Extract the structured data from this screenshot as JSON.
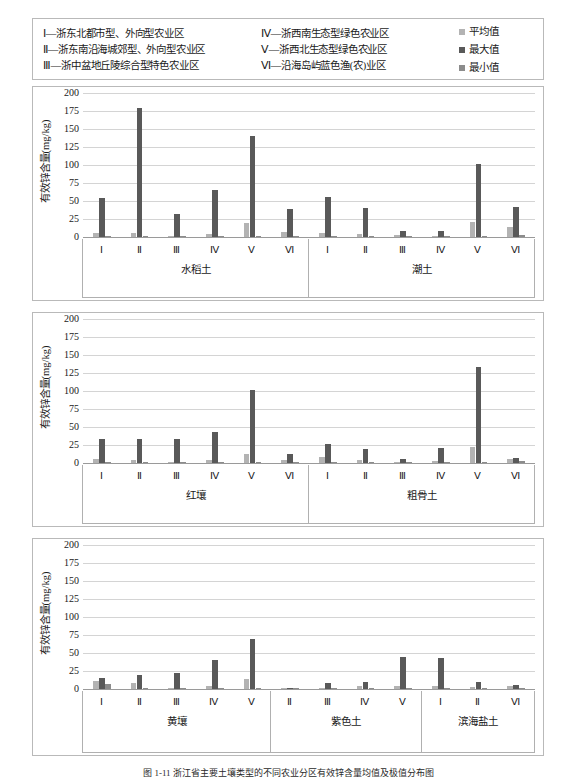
{
  "legend": {
    "regions_left": [
      "Ⅰ—浙东北都市型、外向型农业区",
      "Ⅱ—浙东南沿海城郊型、外向型农业区",
      "Ⅲ—浙中盆地丘陵综合型特色农业区"
    ],
    "regions_right": [
      "Ⅳ—浙西南生态型绿色农业区",
      "Ⅴ—浙西北生态型绿色农业区",
      "Ⅵ—沿海岛屿蓝色渔(农)业区"
    ],
    "series": [
      {
        "label": "平均值",
        "color": "#b3b3b3"
      },
      {
        "label": "最大值",
        "color": "#595959"
      },
      {
        "label": "最小值",
        "color": "#8c8c8c"
      }
    ]
  },
  "caption": "图 1-11  浙江省主要土壤类型的不同农业分区有效锌含量均值及极值分布图",
  "chart_data": [
    {
      "type": "bar",
      "title": "",
      "ylabel": "有效锌含量(mg/kg)",
      "ylim": [
        0,
        200
      ],
      "yticks": [
        0,
        25,
        50,
        75,
        100,
        125,
        150,
        175,
        200
      ],
      "grid": true,
      "legend_position": "top-right",
      "series_names": [
        "平均值",
        "最大值",
        "最小值"
      ],
      "groups": [
        {
          "name": "水稻土",
          "categories": [
            "Ⅰ",
            "Ⅱ",
            "Ⅲ",
            "Ⅳ",
            "Ⅴ",
            "Ⅵ"
          ],
          "series": [
            {
              "name": "平均值",
              "values": [
                5.5,
                6.0,
                2.0,
                4.5,
                19.5,
                7.5
              ]
            },
            {
              "name": "最大值",
              "values": [
                54.0,
                179.0,
                32.5,
                65.5,
                140.5,
                38.5
              ]
            },
            {
              "name": "最小值",
              "values": [
                0.4,
                0.4,
                0.3,
                0.3,
                0.5,
                0.5
              ]
            }
          ]
        },
        {
          "name": "潮土",
          "categories": [
            "Ⅰ",
            "Ⅱ",
            "Ⅲ",
            "Ⅳ",
            "Ⅴ",
            "Ⅵ"
          ],
          "series": [
            {
              "name": "平均值",
              "values": [
                5.5,
                4.5,
                3.0,
                1.5,
                21.0,
                13.5
              ]
            },
            {
              "name": "最大值",
              "values": [
                55.0,
                40.5,
                8.0,
                8.5,
                102.0,
                41.0
              ]
            },
            {
              "name": "最小值",
              "values": [
                0.4,
                0.4,
                0.4,
                0.4,
                2.0,
                2.5
              ]
            }
          ]
        }
      ]
    },
    {
      "type": "bar",
      "title": "",
      "ylabel": "有效锌含量(mg/kg)",
      "ylim": [
        0,
        200
      ],
      "yticks": [
        0,
        25,
        50,
        75,
        100,
        125,
        150,
        175,
        200
      ],
      "grid": true,
      "series_names": [
        "平均值",
        "最大值",
        "最小值"
      ],
      "groups": [
        {
          "name": "红壤",
          "categories": [
            "Ⅰ",
            "Ⅱ",
            "Ⅲ",
            "Ⅳ",
            "Ⅴ",
            "Ⅵ"
          ],
          "series": [
            {
              "name": "平均值",
              "values": [
                6.0,
                4.5,
                2.0,
                4.5,
                13.0,
                4.5
              ]
            },
            {
              "name": "最大值",
              "values": [
                33.0,
                33.0,
                33.5,
                43.0,
                101.0,
                12.0
              ]
            },
            {
              "name": "最小值",
              "values": [
                0.3,
                0.3,
                0.3,
                0.3,
                0.4,
                0.4
              ]
            }
          ]
        },
        {
          "name": "粗骨土",
          "categories": [
            "Ⅰ",
            "Ⅱ",
            "Ⅲ",
            "Ⅳ",
            "Ⅴ",
            "Ⅵ"
          ],
          "series": [
            {
              "name": "平均值",
              "values": [
                9.0,
                4.0,
                1.5,
                3.0,
                22.5,
                5.5
              ]
            },
            {
              "name": "最大值",
              "values": [
                27.0,
                19.0,
                5.5,
                20.5,
                134.0,
                7.5
              ]
            },
            {
              "name": "最小值",
              "values": [
                0.4,
                0.4,
                0.4,
                0.4,
                0.7,
                2.5
              ]
            }
          ]
        }
      ]
    },
    {
      "type": "bar",
      "title": "",
      "ylabel": "有效锌含量(mg/kg)",
      "ylim": [
        0,
        200
      ],
      "yticks": [
        0,
        25,
        50,
        75,
        100,
        125,
        150,
        175,
        200
      ],
      "grid": true,
      "series_names": [
        "平均值",
        "最大值",
        "最小值"
      ],
      "groups": [
        {
          "name": "黄壤",
          "categories": [
            "Ⅰ",
            "Ⅱ",
            "Ⅲ",
            "Ⅳ",
            "Ⅴ"
          ],
          "series": [
            {
              "name": "平均值",
              "values": [
                10.5,
                8.5,
                2.0,
                3.5,
                13.5
              ]
            },
            {
              "name": "最大值",
              "values": [
                15.0,
                19.5,
                22.5,
                40.0,
                69.0
              ]
            },
            {
              "name": "最小值",
              "values": [
                7.0,
                0.4,
                0.4,
                0.4,
                1.5
              ]
            }
          ]
        },
        {
          "name": "紫色土",
          "categories": [
            "Ⅱ",
            "Ⅲ",
            "Ⅳ",
            "Ⅴ"
          ],
          "series": [
            {
              "name": "平均值",
              "values": [
                1.5,
                1.5,
                3.5,
                4.5
              ]
            },
            {
              "name": "最大值",
              "values": [
                2.0,
                8.5,
                9.5,
                44.5
              ]
            },
            {
              "name": "最小值",
              "values": [
                1.5,
                0.4,
                0.4,
                0.5
              ]
            }
          ]
        },
        {
          "name": "滨海盐土",
          "categories": [
            "Ⅰ",
            "Ⅱ",
            "Ⅵ"
          ],
          "series": [
            {
              "name": "平均值",
              "values": [
                4.0,
                3.0,
                4.0
              ]
            },
            {
              "name": "最大值",
              "values": [
                42.5,
                9.5,
                5.5
              ]
            },
            {
              "name": "最小值",
              "values": [
                0.4,
                0.5,
                1.5
              ]
            }
          ]
        }
      ]
    }
  ]
}
